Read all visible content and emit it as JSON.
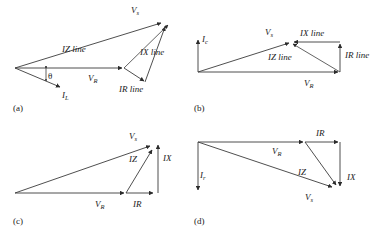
{
  "figure": {
    "background": "#ffffff",
    "line_color": "#3b3b3b",
    "text_color": "#1a1a1a",
    "panels": [
      {
        "tag": "(a)",
        "labels": {
          "vs": "V",
          "vs_sub": "s",
          "iz": "IZ line",
          "ix": "IX line",
          "ir": "IR line",
          "vr": "V",
          "vr_sub": "R",
          "il": "I",
          "il_sub": "L",
          "theta": "θ"
        }
      },
      {
        "tag": "(b)",
        "labels": {
          "ic": "I",
          "ic_sub": "c",
          "vs": "V",
          "vs_sub": "s",
          "ix": "IX line",
          "iz": "IZ line",
          "ir": "IR line",
          "vr": "V",
          "vr_sub": "R"
        }
      },
      {
        "tag": "(c)",
        "labels": {
          "vs": "V",
          "vs_sub": "s",
          "iz": "IZ",
          "ix": "IX",
          "vr": "V",
          "vr_sub": "R",
          "ir": "IR"
        }
      },
      {
        "tag": "(d)",
        "labels": {
          "ir_vert": "I",
          "ir_vert_sub": "r",
          "ir_top": "IR",
          "vr": "V",
          "vr_sub": "R",
          "iz": "IZ",
          "ix": "IX",
          "vs": "V",
          "vs_sub": "s"
        }
      }
    ]
  }
}
